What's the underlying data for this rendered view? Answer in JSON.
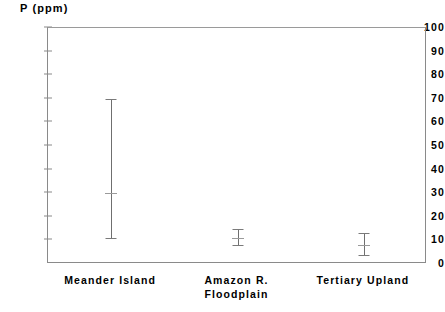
{
  "chart_data": {
    "type": "bar",
    "title": "",
    "ylabel": "P (ppm)",
    "xlabel": "",
    "ylim": [
      0,
      100
    ],
    "ytick_step": 10,
    "yticks": [
      "0",
      "10",
      "20",
      "30",
      "40",
      "50",
      "60",
      "70",
      "80",
      "90",
      "100"
    ],
    "ytick_values": [
      0,
      10,
      20,
      30,
      40,
      50,
      60,
      70,
      80,
      90,
      100
    ],
    "grid": false,
    "legend": "none",
    "categories": [
      "Meander Island",
      "Amazon R.\nFloodplain",
      "Tertiary Upland"
    ],
    "series": [
      {
        "name": "P (ppm) range",
        "mean": [
          30,
          11,
          8
        ],
        "low": [
          11,
          8,
          4
        ],
        "high": [
          70,
          15,
          13
        ]
      }
    ],
    "points": [
      {
        "category": "Meander Island",
        "low": 11,
        "mean": 30,
        "high": 70
      },
      {
        "category": "Amazon R. Floodplain",
        "low": 8,
        "mean": 11,
        "high": 15
      },
      {
        "category": "Tertiary Upland",
        "low": 4,
        "mean": 8,
        "high": 13
      }
    ],
    "colors": {
      "axis": "#8a8a8a",
      "bar": "#6f6f6f",
      "cap": "#7a7a7a",
      "mean": "#9a9a9a",
      "text": "#000000",
      "background": "#ffffff"
    }
  }
}
